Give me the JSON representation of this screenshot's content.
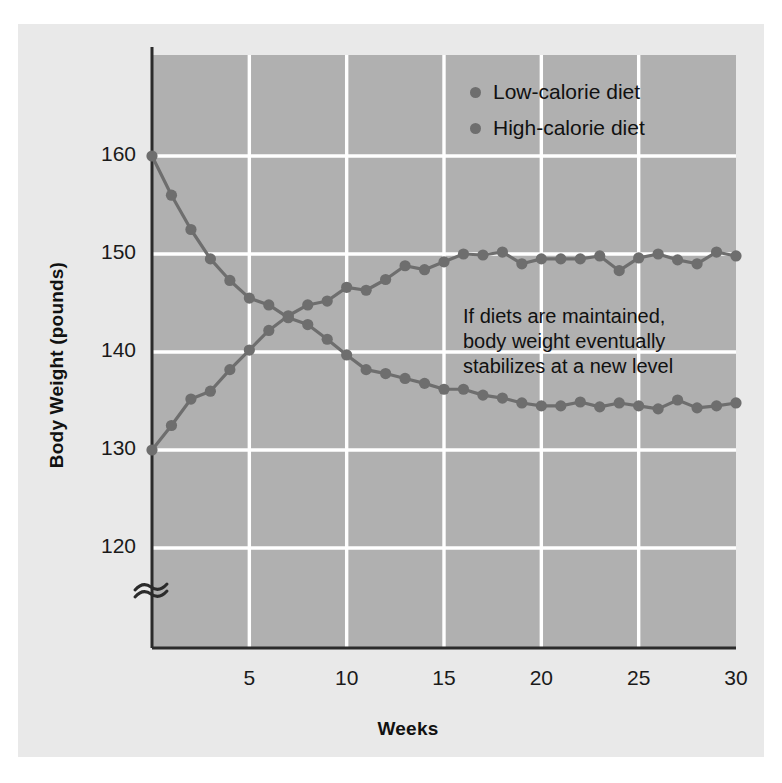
{
  "figure": {
    "background_color": "#e9e9e9",
    "plot_background_color": "#b0b0b0",
    "gridline_color": "#ffffff",
    "axis_color": "#2b2b2b",
    "series_color": "#6e6e6e"
  },
  "axes": {
    "ylabel": "Body Weight (pounds)",
    "xlabel": "Weeks",
    "yticks": [
      "120",
      "130",
      "140",
      "150",
      "160"
    ],
    "xticks": [
      "5",
      "10",
      "15",
      "20",
      "25",
      "30"
    ],
    "y_axis_break": "axis-break-squiggle"
  },
  "legend": {
    "items": [
      {
        "label": "Low-calorie diet",
        "color": "#6e6e6e",
        "marker": "circle"
      },
      {
        "label": "High-calorie diet",
        "color": "#6e6e6e",
        "marker": "circle"
      }
    ]
  },
  "annotation": {
    "text": "If diets are maintained,\nbody weight eventually\nstabilizes at a new level"
  },
  "chart_data": {
    "type": "line",
    "title": "",
    "xlabel": "Weeks",
    "ylabel": "Body Weight (pounds)",
    "xlim": [
      0,
      30
    ],
    "ylim": [
      115,
      163
    ],
    "ytick_values": [
      120,
      130,
      140,
      150,
      160
    ],
    "xtick_values": [
      5,
      10,
      15,
      20,
      25,
      30
    ],
    "grid": true,
    "legend_position": "top-right",
    "x": [
      0,
      1,
      2,
      3,
      4,
      5,
      6,
      7,
      8,
      9,
      10,
      11,
      12,
      13,
      14,
      15,
      16,
      17,
      18,
      19,
      20,
      21,
      22,
      23,
      24,
      25,
      26,
      27,
      28,
      29,
      30
    ],
    "series": [
      {
        "name": "Low-calorie diet",
        "color": "#6e6e6e",
        "values": [
          160.0,
          156.0,
          152.5,
          149.5,
          147.3,
          145.5,
          144.8,
          143.5,
          142.8,
          141.3,
          139.7,
          138.2,
          137.8,
          137.3,
          136.8,
          136.2,
          136.2,
          135.6,
          135.3,
          134.8,
          134.5,
          134.5,
          134.9,
          134.4,
          134.8,
          134.5,
          134.2,
          135.1,
          134.3,
          134.5,
          134.8
        ]
      },
      {
        "name": "High-calorie diet",
        "color": "#6e6e6e",
        "values": [
          130.0,
          132.5,
          135.2,
          136.0,
          138.2,
          140.2,
          142.2,
          143.7,
          144.8,
          145.2,
          146.6,
          146.3,
          147.4,
          148.8,
          148.4,
          149.2,
          150.0,
          149.9,
          150.2,
          149.0,
          149.5,
          149.5,
          149.5,
          149.8,
          148.3,
          149.6,
          150.0,
          149.4,
          149.0,
          150.2,
          149.8
        ]
      }
    ]
  }
}
